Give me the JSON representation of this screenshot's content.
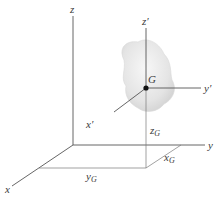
{
  "figure": {
    "colors": {
      "axis": "#555555",
      "body_fill": "#e6e6e6",
      "body_edge": "#d0d0d0",
      "point": "#111111",
      "text": "#3a3a3a"
    },
    "labels": {
      "z": "z",
      "y": "y",
      "x": "x",
      "z_prime": "z′",
      "y_prime": "y′",
      "x_prime": "x′",
      "G": "G",
      "zG_main": "z",
      "zG_sub": "G",
      "yG_main": "y",
      "yG_sub": "G",
      "xG_main": "x",
      "xG_sub": "G"
    }
  }
}
